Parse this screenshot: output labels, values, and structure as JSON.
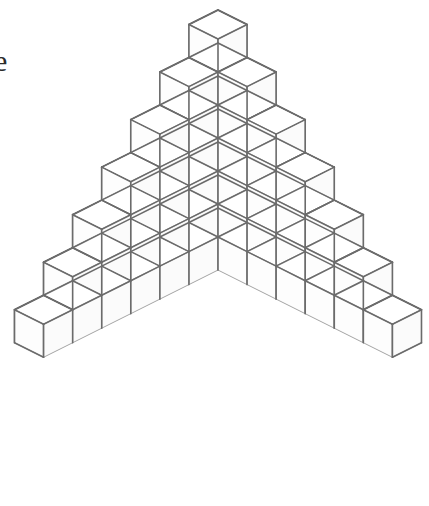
{
  "figure": {
    "kind": "line-drawing"
  },
  "annotation": {
    "cut_off_text": "e",
    "cut_off_text_note": "partial serif letter clipped at the left edge of the page"
  },
  "colors": {
    "background": "#ffffff",
    "face_top": "#ffffff",
    "face_left": "#fdfdfd",
    "face_right": "#fbfbfb",
    "outline_outer": "#6b6b6b",
    "outline_inner": "#9a9a9a",
    "text": "#2b2b2b"
  },
  "chart_data": {
    "type": "diagram",
    "projection": "isometric",
    "levels": 7,
    "level_sizes": [
      1,
      2,
      3,
      4,
      5,
      6,
      7
    ],
    "cubes_per_level": [
      1,
      4,
      9,
      16,
      25,
      36,
      49
    ],
    "total_cubes": 140,
    "geometry": {
      "apex_x": 218,
      "apex_y": 10,
      "half_width_px": 29.07,
      "half_depth_px": 14.535,
      "cube_height_px": 33,
      "base_left_x": 14,
      "base_right_x": 421,
      "base_top_y": 347,
      "base_bottom_y": 498
    },
    "stroke": {
      "outer_width": 1.6,
      "inner_width": 0.9
    }
  }
}
